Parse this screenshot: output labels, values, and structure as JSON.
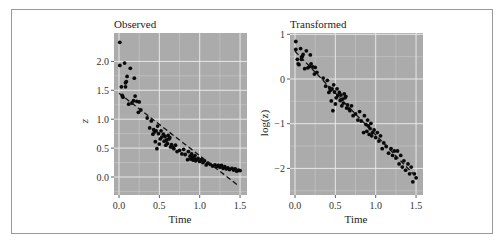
{
  "figure": {
    "panels": [
      {
        "title": "Observed",
        "xlabel": "Time",
        "ylabel": "z"
      },
      {
        "title": "Transformed",
        "xlabel": "Time",
        "ylabel": "log(z)"
      }
    ]
  },
  "chart_data": [
    {
      "type": "scatter",
      "title": "Observed",
      "xlabel": "Time",
      "ylabel": "z",
      "xlim": [
        -0.05,
        1.55
      ],
      "ylim": [
        -0.3,
        2.45
      ],
      "xticks": [
        0.0,
        0.5,
        1.0,
        1.5
      ],
      "xtick_labels": [
        "0.0",
        "0.5",
        "1.0",
        "1.5"
      ],
      "yticks": [
        0.0,
        0.5,
        1.0,
        1.5,
        2.0
      ],
      "ytick_labels": [
        "0.0",
        "0.5",
        "1.0",
        "1.5",
        "2.0"
      ],
      "grid": true,
      "background": "#ababab",
      "series": [
        {
          "name": "points",
          "style": "black dots",
          "x": [
            0.01,
            0.01,
            0.03,
            0.04,
            0.05,
            0.07,
            0.08,
            0.08,
            0.09,
            0.1,
            0.12,
            0.14,
            0.16,
            0.18,
            0.19,
            0.2,
            0.22,
            0.24,
            0.25,
            0.27,
            0.35,
            0.38,
            0.4,
            0.42,
            0.43,
            0.44,
            0.45,
            0.46,
            0.47,
            0.48,
            0.49,
            0.5,
            0.51,
            0.52,
            0.53,
            0.55,
            0.56,
            0.57,
            0.58,
            0.59,
            0.6,
            0.61,
            0.62,
            0.63,
            0.64,
            0.65,
            0.67,
            0.68,
            0.7,
            0.72,
            0.75,
            0.78,
            0.8,
            0.82,
            0.85,
            0.86,
            0.88,
            0.89,
            0.9,
            0.91,
            0.92,
            0.93,
            0.94,
            0.95,
            0.96,
            0.98,
            1.0,
            1.02,
            1.04,
            1.06,
            1.08,
            1.1,
            1.13,
            1.16,
            1.19,
            1.21,
            1.23,
            1.25,
            1.27,
            1.29,
            1.31,
            1.33,
            1.35,
            1.37,
            1.4,
            1.42,
            1.44,
            1.46,
            1.48,
            1.5
          ],
          "y": [
            2.33,
            1.93,
            1.56,
            1.41,
            1.38,
            1.97,
            1.63,
            1.56,
            1.65,
            1.74,
            1.26,
            1.88,
            1.28,
            1.32,
            1.71,
            1.4,
            1.31,
            1.12,
            1.3,
            1.16,
            1.02,
            0.85,
            0.97,
            0.74,
            0.82,
            0.78,
            0.61,
            0.8,
            0.49,
            0.88,
            0.75,
            0.57,
            0.66,
            0.8,
            0.69,
            0.74,
            0.62,
            0.7,
            0.55,
            0.64,
            0.58,
            0.72,
            0.66,
            0.68,
            0.52,
            0.56,
            0.51,
            0.49,
            0.55,
            0.44,
            0.46,
            0.4,
            0.48,
            0.39,
            0.3,
            0.44,
            0.36,
            0.31,
            0.4,
            0.35,
            0.29,
            0.33,
            0.37,
            0.28,
            0.3,
            0.32,
            0.27,
            0.3,
            0.25,
            0.28,
            0.21,
            0.24,
            0.22,
            0.19,
            0.21,
            0.18,
            0.2,
            0.17,
            0.2,
            0.15,
            0.18,
            0.14,
            0.16,
            0.13,
            0.15,
            0.12,
            0.14,
            0.1,
            0.12,
            0.11
          ]
        },
        {
          "name": "linear fit",
          "style": "dashed line",
          "x": [
            0.0,
            1.48
          ],
          "y": [
            1.45,
            -0.15
          ]
        }
      ]
    },
    {
      "type": "scatter",
      "title": "Transformed",
      "xlabel": "Time",
      "ylabel": "log(z)",
      "xlim": [
        -0.05,
        1.55
      ],
      "ylim": [
        -2.65,
        1.0
      ],
      "xticks": [
        0.0,
        0.5,
        1.0,
        1.5
      ],
      "xtick_labels": [
        "0.0",
        "0.5",
        "1.0",
        "1.5"
      ],
      "yticks": [
        -2,
        -1,
        0,
        1
      ],
      "ytick_labels": [
        "−2",
        "−1",
        "0",
        "1"
      ],
      "grid": true,
      "background": "#ababab",
      "series": [
        {
          "name": "points",
          "style": "black dots",
          "x": [
            0.01,
            0.01,
            0.03,
            0.04,
            0.05,
            0.07,
            0.08,
            0.08,
            0.09,
            0.1,
            0.12,
            0.14,
            0.16,
            0.18,
            0.19,
            0.2,
            0.22,
            0.24,
            0.25,
            0.27,
            0.35,
            0.38,
            0.4,
            0.42,
            0.43,
            0.44,
            0.45,
            0.46,
            0.47,
            0.48,
            0.49,
            0.5,
            0.51,
            0.52,
            0.53,
            0.55,
            0.56,
            0.57,
            0.58,
            0.59,
            0.6,
            0.61,
            0.62,
            0.63,
            0.64,
            0.65,
            0.67,
            0.68,
            0.7,
            0.72,
            0.75,
            0.78,
            0.8,
            0.82,
            0.85,
            0.86,
            0.88,
            0.89,
            0.9,
            0.91,
            0.92,
            0.93,
            0.94,
            0.95,
            0.96,
            0.98,
            1.0,
            1.02,
            1.04,
            1.06,
            1.08,
            1.1,
            1.13,
            1.16,
            1.19,
            1.21,
            1.23,
            1.25,
            1.27,
            1.29,
            1.31,
            1.33,
            1.35,
            1.37,
            1.4,
            1.42,
            1.44,
            1.46,
            1.48,
            1.5
          ],
          "y": [
            0.84,
            0.66,
            0.44,
            0.34,
            0.32,
            0.68,
            0.49,
            0.44,
            0.5,
            0.55,
            0.23,
            0.63,
            0.25,
            0.28,
            0.54,
            0.34,
            0.27,
            0.11,
            0.26,
            0.15,
            0.02,
            -0.16,
            -0.03,
            -0.3,
            -0.2,
            -0.25,
            -0.49,
            -0.22,
            -0.71,
            -0.13,
            -0.29,
            -0.56,
            -0.42,
            -0.22,
            -0.37,
            -0.3,
            -0.48,
            -0.36,
            -0.6,
            -0.45,
            -0.54,
            -0.33,
            -0.42,
            -0.39,
            -0.65,
            -0.58,
            -0.67,
            -0.71,
            -0.6,
            -0.82,
            -0.78,
            -0.92,
            -0.73,
            -0.94,
            -1.2,
            -0.82,
            -1.02,
            -1.17,
            -0.92,
            -1.05,
            -1.24,
            -1.11,
            -0.99,
            -1.27,
            -1.2,
            -1.14,
            -1.31,
            -1.2,
            -1.39,
            -1.27,
            -1.56,
            -1.43,
            -1.51,
            -1.66,
            -1.56,
            -1.71,
            -1.61,
            -1.77,
            -1.61,
            -1.9,
            -1.71,
            -1.97,
            -1.83,
            -2.04,
            -1.9,
            -2.12,
            -1.97,
            -2.3,
            -2.12,
            -2.21
          ]
        },
        {
          "name": "linear fit",
          "style": "dashed line",
          "x": [
            0.0,
            1.48
          ],
          "y": [
            0.62,
            -2.15
          ]
        }
      ]
    }
  ]
}
